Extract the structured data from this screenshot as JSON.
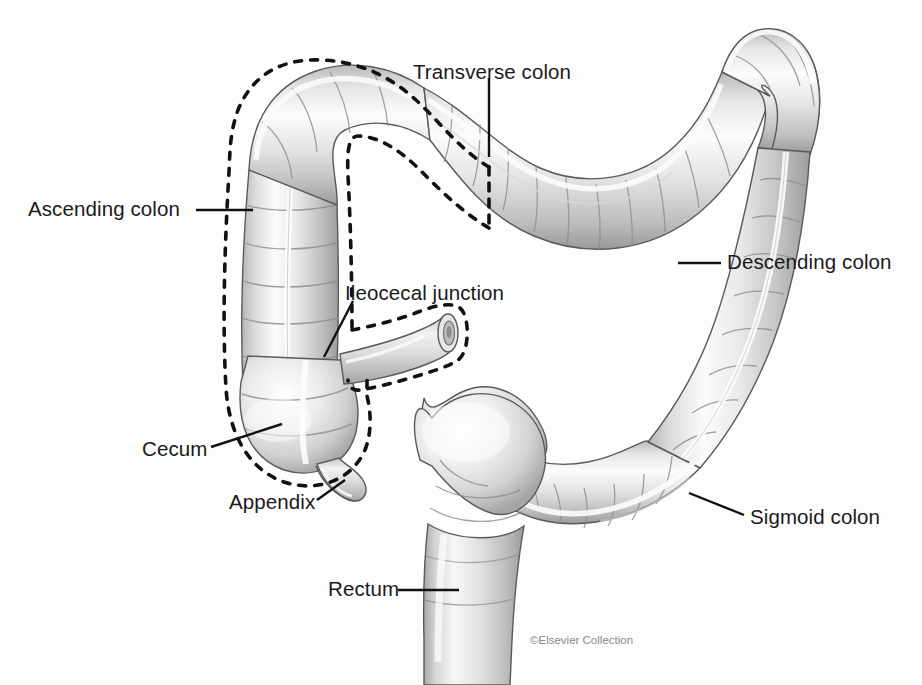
{
  "figure": {
    "background_color": "#fdfdfd",
    "credit": "©Elsevier Collection"
  },
  "labels": [
    {
      "id": "transverse-colon",
      "text": "Transverse colon",
      "x": 413,
      "y": 62,
      "anchor": "start"
    },
    {
      "id": "ascending-colon",
      "text": "Ascending colon",
      "x": 28,
      "y": 199,
      "anchor": "start"
    },
    {
      "id": "descending-colon",
      "text": "Descending colon",
      "x": 727,
      "y": 252,
      "anchor": "start"
    },
    {
      "id": "ileocecal-junction",
      "text": "Ileocecal junction",
      "x": 345,
      "y": 283,
      "anchor": "start"
    },
    {
      "id": "cecum",
      "text": "Cecum",
      "x": 142,
      "y": 439,
      "anchor": "start"
    },
    {
      "id": "appendix",
      "text": "Appendix",
      "x": 229,
      "y": 492,
      "anchor": "start"
    },
    {
      "id": "sigmoid-colon",
      "text": "Sigmoid colon",
      "x": 750,
      "y": 507,
      "anchor": "start"
    },
    {
      "id": "rectum",
      "text": "Rectum",
      "x": 328,
      "y": 579,
      "anchor": "start"
    }
  ],
  "leader_lines": [
    {
      "id": "transverse-colon-leader",
      "points": "489,78 489,155"
    },
    {
      "id": "ascending-colon-leader",
      "points": "196,210 251,210"
    },
    {
      "id": "descending-colon-leader",
      "points": "721,263 679,263"
    },
    {
      "id": "ileocecal-junction-leader",
      "points": "352,300 325,355"
    },
    {
      "id": "cecum-leader",
      "points": "212,447 281,425"
    },
    {
      "id": "appendix-leader",
      "points": "318,500 343,481"
    },
    {
      "id": "sigmoid-colon-leader",
      "points": "744,515 690,494"
    },
    {
      "id": "rectum-leader",
      "points": "399,590 458,590"
    }
  ],
  "colors": {
    "outline": "#4a4a4a",
    "label": "#1a1a1a",
    "leader": "#111111",
    "dashed_region": "#111111",
    "credit": "#8a8a8a",
    "tissue_light": "#ffffff",
    "tissue_mid": "#d8d8d8",
    "tissue_shadow": "#9a9a9a"
  },
  "structures": [
    {
      "id": "ascending-colon",
      "name": "Ascending colon",
      "dashed_outlined": true
    },
    {
      "id": "hepatic-flexure",
      "name": "Hepatic flexure",
      "dashed_outlined": true
    },
    {
      "id": "transverse-colon",
      "name": "Transverse colon",
      "dashed_outlined": true
    },
    {
      "id": "splenic-flexure",
      "name": "Splenic flexure",
      "dashed_outlined": false
    },
    {
      "id": "descending-colon",
      "name": "Descending colon",
      "dashed_outlined": false
    },
    {
      "id": "sigmoid-colon",
      "name": "Sigmoid colon",
      "dashed_outlined": false
    },
    {
      "id": "rectum",
      "name": "Rectum",
      "dashed_outlined": false
    },
    {
      "id": "cecum",
      "name": "Cecum",
      "dashed_outlined": true
    },
    {
      "id": "appendix",
      "name": "Appendix",
      "dashed_outlined": false
    },
    {
      "id": "ileum",
      "name": "Ileum",
      "dashed_outlined": true
    }
  ]
}
